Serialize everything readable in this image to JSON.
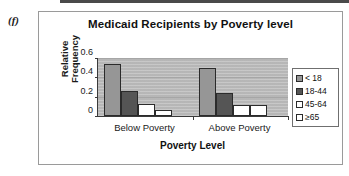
{
  "figure": {
    "label": "(f)"
  },
  "chart_data": {
    "type": "bar",
    "title": "Medicaid Recipients by Poverty level",
    "xlabel": "Poverty Level",
    "ylabel": "Relative Frequency",
    "ylabel_line1": "Relative",
    "ylabel_line2": "Frequency",
    "categories": [
      "Below Poverty",
      "Above Poverty"
    ],
    "ylim": [
      0,
      0.6
    ],
    "yticks": [
      "0.6",
      "0.4",
      "0.2",
      "0"
    ],
    "ytick_values": [
      0.6,
      0.4,
      0.2,
      0
    ],
    "grid": true,
    "legend_position": "right",
    "plot_background": "#bdbdbd",
    "series": [
      {
        "name": "< 18",
        "color": "#969696",
        "values": [
          0.54,
          0.5
        ]
      },
      {
        "name": "18-44",
        "color": "#555555",
        "values": [
          0.26,
          0.24
        ]
      },
      {
        "name": "45-64",
        "color": "#ffffff",
        "values": [
          0.12,
          0.11
        ]
      },
      {
        "name": "≥65",
        "color": "#ffffff",
        "values": [
          0.065,
          0.11
        ]
      }
    ]
  }
}
